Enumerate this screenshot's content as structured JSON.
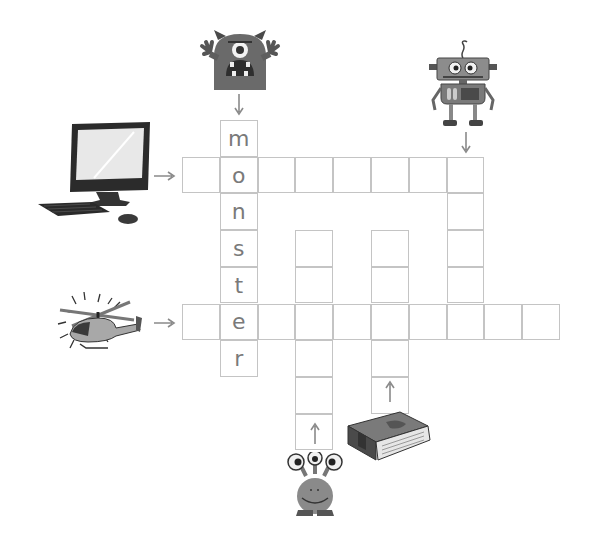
{
  "puzzle": {
    "type": "picture crossword",
    "given_word": "monster",
    "grid": {
      "origin_x": 182,
      "origin_y": 120,
      "cell_w": 37.8,
      "cell_h": 36.7,
      "entries": [
        {
          "clue": "monster",
          "direction": "down",
          "col": 1,
          "row": 0,
          "length": 7,
          "letters": [
            "m",
            "o",
            "n",
            "s",
            "t",
            "e",
            "r"
          ]
        },
        {
          "clue": "computer",
          "direction": "across",
          "col": 0,
          "row": 1,
          "length": 8,
          "letters": [
            "",
            "",
            "",
            "",
            "",
            "",
            "",
            ""
          ]
        },
        {
          "clue": "helicopter",
          "direction": "across",
          "col": 0,
          "row": 5,
          "length": 10,
          "letters": [
            "",
            "",
            "",
            "",
            "",
            "",
            "",
            "",
            "",
            ""
          ]
        },
        {
          "clue": "robot",
          "direction": "down",
          "col": 7,
          "row": 1,
          "length": 5,
          "letters": [
            "",
            "",
            "",
            "",
            ""
          ]
        },
        {
          "clue": "alien",
          "direction": "up",
          "col": 3,
          "row": 3,
          "length": 6,
          "letters": [
            "",
            "",
            "",
            "",
            "",
            ""
          ]
        },
        {
          "clue": "book",
          "direction": "up",
          "col": 5,
          "row": 3,
          "length": 5,
          "letters": [
            "",
            "",
            "",
            "",
            ""
          ]
        }
      ]
    },
    "clues": [
      {
        "icon": "monster-icon",
        "label": "monster"
      },
      {
        "icon": "robot-icon",
        "label": "robot"
      },
      {
        "icon": "computer-icon",
        "label": "computer"
      },
      {
        "icon": "helicopter-icon",
        "label": "helicopter"
      },
      {
        "icon": "alien-icon",
        "label": "alien"
      },
      {
        "icon": "book-icon",
        "label": "book"
      }
    ],
    "colors": {
      "grid_line": "#c4c4c4",
      "letter": "#7a7a7a",
      "arrow": "#8a8a8a"
    }
  }
}
